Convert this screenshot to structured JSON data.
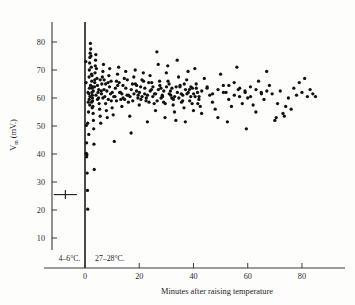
{
  "figure": {
    "background_color": "#fdfdfc",
    "point_color": "#111111",
    "axis_color": "#3a3a3a"
  },
  "axes": {
    "y_label_symbol": "V",
    "y_label_subscript": "m",
    "y_label_units": "(mV.)",
    "x_label": "Minutes after raising temperature",
    "y_ticks": [
      10,
      20,
      30,
      40,
      50,
      60,
      70,
      80
    ],
    "x_ticks": [
      0,
      20,
      40,
      60,
      80
    ],
    "y_tick_labels": [
      "10",
      "20",
      "30",
      "40",
      "50",
      "60",
      "70",
      "80"
    ],
    "x_tick_labels": [
      "0",
      "20",
      "40",
      "60",
      "80"
    ]
  },
  "annotations": {
    "cold_phase_label": "4–6°C.",
    "warm_phase_label": "27–28°C."
  },
  "chart_data": {
    "type": "scatter",
    "title": "",
    "xlabel": "Minutes after raising temperature",
    "ylabel": "Vm (mV.)",
    "xlim": [
      -13,
      94
    ],
    "ylim": [
      4,
      88
    ],
    "grid": false,
    "legend": null,
    "divider_x": 0,
    "cold_phase": {
      "label": "4–6°C.",
      "mean_value": 25.5,
      "error_bar_low": -11.5,
      "error_bar_high": -3.0,
      "marker": "horizontal-error-bar"
    },
    "warm_phase": {
      "label": "27–28°C."
    },
    "points": [
      [
        0.3,
        73.0
      ],
      [
        0.4,
        65.5
      ],
      [
        0.5,
        50.2
      ],
      [
        0.6,
        44.0
      ],
      [
        0.5,
        40.2
      ],
      [
        0.7,
        39.8
      ],
      [
        0.6,
        39.0
      ],
      [
        0.8,
        33.2
      ],
      [
        0.9,
        27.0
      ],
      [
        1.0,
        20.3
      ],
      [
        1.1,
        62.0
      ],
      [
        1.2,
        58.5
      ],
      [
        1.3,
        55.0
      ],
      [
        1.0,
        51.0
      ],
      [
        1.4,
        47.0
      ],
      [
        1.5,
        67.5
      ],
      [
        1.6,
        70.0
      ],
      [
        1.7,
        72.5
      ],
      [
        1.8,
        74.5
      ],
      [
        1.9,
        76.0
      ],
      [
        2.0,
        79.5
      ],
      [
        2.1,
        77.5
      ],
      [
        2.2,
        75.0
      ],
      [
        2.3,
        71.0
      ],
      [
        2.4,
        68.5
      ],
      [
        2.5,
        66.0
      ],
      [
        2.6,
        63.5
      ],
      [
        2.7,
        61.0
      ],
      [
        2.8,
        59.0
      ],
      [
        2.9,
        57.0
      ],
      [
        3.0,
        54.5
      ],
      [
        3.1,
        52.0
      ],
      [
        3.2,
        49.0
      ],
      [
        3.3,
        43.5
      ],
      [
        3.4,
        34.5
      ],
      [
        3.5,
        64.0
      ],
      [
        3.6,
        66.5
      ],
      [
        3.7,
        69.0
      ],
      [
        3.8,
        71.5
      ],
      [
        3.9,
        73.5
      ],
      [
        4.0,
        75.5
      ],
      [
        4.2,
        70.5
      ],
      [
        4.4,
        67.0
      ],
      [
        4.6,
        64.5
      ],
      [
        4.8,
        62.0
      ],
      [
        5.0,
        60.0
      ],
      [
        5.2,
        58.0
      ],
      [
        5.4,
        56.0
      ],
      [
        5.6,
        53.5
      ],
      [
        5.8,
        51.0
      ],
      [
        6.0,
        62.5
      ],
      [
        6.2,
        65.0
      ],
      [
        6.4,
        67.5
      ],
      [
        6.6,
        69.5
      ],
      [
        6.8,
        72.0
      ],
      [
        7.0,
        63.0
      ],
      [
        7.3,
        60.5
      ],
      [
        7.6,
        58.0
      ],
      [
        7.9,
        55.5
      ],
      [
        8.2,
        53.0
      ],
      [
        8.5,
        65.5
      ],
      [
        8.8,
        68.0
      ],
      [
        9.1,
        70.5
      ],
      [
        9.4,
        61.5
      ],
      [
        9.7,
        59.0
      ],
      [
        10.0,
        56.5
      ],
      [
        10.4,
        54.0
      ],
      [
        10.8,
        44.5
      ],
      [
        11.2,
        63.5
      ],
      [
        11.6,
        66.0
      ],
      [
        12.0,
        68.5
      ],
      [
        12.4,
        71.0
      ],
      [
        12.8,
        62.0
      ],
      [
        13.2,
        59.5
      ],
      [
        13.6,
        57.0
      ],
      [
        14.0,
        64.5
      ],
      [
        14.5,
        67.0
      ],
      [
        15.0,
        69.5
      ],
      [
        15.5,
        61.0
      ],
      [
        16.0,
        58.5
      ],
      [
        16.5,
        53.5
      ],
      [
        17.0,
        47.5
      ],
      [
        17.5,
        65.0
      ],
      [
        18.0,
        67.5
      ],
      [
        18.5,
        70.0
      ],
      [
        19.0,
        62.5
      ],
      [
        19.5,
        60.0
      ],
      [
        20.0,
        57.5
      ],
      [
        20.5,
        64.0
      ],
      [
        21.0,
        66.5
      ],
      [
        21.5,
        69.0
      ],
      [
        22.0,
        61.5
      ],
      [
        22.5,
        59.0
      ],
      [
        23.0,
        51.5
      ],
      [
        23.5,
        65.5
      ],
      [
        24.0,
        68.0
      ],
      [
        24.5,
        63.0
      ],
      [
        25.0,
        60.5
      ],
      [
        25.5,
        58.0
      ],
      [
        26.0,
        55.5
      ],
      [
        26.5,
        76.5
      ],
      [
        27.0,
        72.0
      ],
      [
        27.5,
        66.0
      ],
      [
        28.0,
        63.5
      ],
      [
        28.5,
        61.0
      ],
      [
        29.0,
        58.5
      ],
      [
        29.5,
        53.0
      ],
      [
        30.0,
        69.0
      ],
      [
        30.5,
        71.5
      ],
      [
        31.0,
        65.0
      ],
      [
        31.5,
        62.5
      ],
      [
        32.0,
        60.0
      ],
      [
        32.5,
        57.5
      ],
      [
        33.0,
        55.0
      ],
      [
        33.5,
        52.0
      ],
      [
        34.0,
        73.5
      ],
      [
        34.5,
        67.5
      ],
      [
        35.0,
        64.0
      ],
      [
        35.5,
        61.5
      ],
      [
        36.0,
        59.0
      ],
      [
        36.5,
        56.5
      ],
      [
        37.0,
        51.5
      ],
      [
        37.5,
        66.5
      ],
      [
        38.0,
        69.5
      ],
      [
        38.5,
        63.0
      ],
      [
        39.0,
        60.5
      ],
      [
        39.5,
        58.0
      ],
      [
        40.0,
        55.5
      ],
      [
        40.5,
        70.5
      ],
      [
        41.0,
        65.0
      ],
      [
        41.5,
        62.0
      ],
      [
        42.0,
        59.5
      ],
      [
        42.5,
        57.0
      ],
      [
        43.0,
        54.5
      ],
      [
        44.0,
        67.0
      ],
      [
        45.0,
        63.5
      ],
      [
        46.0,
        61.0
      ],
      [
        47.0,
        58.5
      ],
      [
        48.0,
        56.0
      ],
      [
        49.0,
        53.0
      ],
      [
        50.0,
        68.5
      ],
      [
        51.0,
        64.5
      ],
      [
        52.0,
        62.0
      ],
      [
        52.5,
        51.5
      ],
      [
        53.0,
        59.5
      ],
      [
        54.0,
        57.0
      ],
      [
        55.0,
        65.5
      ],
      [
        56.0,
        71.0
      ],
      [
        56.5,
        63.0
      ],
      [
        57.0,
        60.5
      ],
      [
        58.0,
        58.0
      ],
      [
        59.0,
        62.5
      ],
      [
        59.5,
        49.0
      ],
      [
        60.0,
        60.0
      ],
      [
        61.0,
        64.0
      ],
      [
        62.0,
        57.5
      ],
      [
        63.0,
        55.0
      ],
      [
        64.0,
        66.0
      ],
      [
        65.0,
        62.0
      ],
      [
        66.0,
        59.5
      ],
      [
        67.0,
        69.5
      ],
      [
        68.0,
        64.5
      ],
      [
        69.0,
        61.5
      ],
      [
        70.0,
        52.0
      ],
      [
        70.5,
        53.0
      ],
      [
        71.0,
        58.0
      ],
      [
        72.0,
        62.5
      ],
      [
        73.0,
        54.5
      ],
      [
        73.5,
        53.5
      ],
      [
        74.0,
        57.0
      ],
      [
        75.0,
        60.0
      ],
      [
        76.0,
        56.0
      ],
      [
        77.0,
        63.5
      ],
      [
        78.0,
        61.0
      ],
      [
        79.0,
        65.5
      ],
      [
        80.0,
        62.0
      ],
      [
        81.0,
        67.0
      ],
      [
        82.0,
        60.5
      ],
      [
        83.0,
        63.0
      ],
      [
        84.0,
        61.5
      ],
      [
        85.0,
        60.5
      ],
      [
        2.05,
        64.5
      ],
      [
        3.05,
        62.5
      ],
      [
        4.05,
        61.0
      ],
      [
        5.05,
        63.0
      ],
      [
        6.05,
        61.5
      ],
      [
        7.05,
        66.5
      ],
      [
        8.05,
        62.5
      ],
      [
        9.05,
        64.0
      ],
      [
        10.05,
        62.0
      ],
      [
        11.05,
        60.5
      ],
      [
        12.05,
        64.5
      ],
      [
        13.05,
        62.0
      ],
      [
        14.05,
        60.0
      ],
      [
        15.05,
        63.5
      ],
      [
        16.05,
        61.0
      ],
      [
        17.05,
        63.0
      ],
      [
        18.05,
        61.5
      ],
      [
        19.05,
        64.5
      ],
      [
        20.05,
        62.0
      ],
      [
        21.05,
        60.5
      ],
      [
        22.05,
        63.5
      ],
      [
        23.05,
        61.0
      ],
      [
        24.05,
        62.5
      ],
      [
        25.05,
        64.0
      ],
      [
        26.05,
        61.5
      ],
      [
        27.05,
        63.0
      ],
      [
        28.05,
        60.0
      ],
      [
        29.05,
        62.5
      ],
      [
        30.05,
        64.0
      ],
      [
        31.05,
        61.5
      ],
      [
        32.05,
        63.5
      ],
      [
        33.05,
        60.5
      ],
      [
        34.05,
        62.0
      ],
      [
        35.05,
        64.5
      ],
      [
        36.05,
        61.0
      ],
      [
        37.05,
        63.0
      ],
      [
        38.05,
        62.0
      ],
      [
        39.05,
        64.0
      ],
      [
        40.05,
        61.5
      ],
      [
        41.05,
        63.5
      ],
      [
        42.05,
        60.5
      ],
      [
        43.05,
        62.5
      ],
      [
        45.05,
        64.0
      ],
      [
        47.05,
        61.5
      ],
      [
        49.05,
        63.0
      ],
      [
        51.05,
        62.0
      ],
      [
        53.05,
        64.5
      ],
      [
        55.05,
        61.0
      ],
      [
        57.05,
        63.5
      ],
      [
        59.05,
        62.0
      ],
      [
        61.05,
        60.5
      ],
      [
        63.05,
        63.0
      ],
      [
        65.05,
        61.5
      ],
      [
        67.05,
        62.5
      ],
      [
        2.6,
        68.0
      ],
      [
        3.6,
        65.5
      ],
      [
        4.6,
        59.5
      ],
      [
        5.6,
        66.5
      ],
      [
        6.6,
        60.0
      ],
      [
        7.6,
        65.0
      ],
      [
        8.6,
        59.5
      ],
      [
        9.6,
        66.0
      ],
      [
        10.6,
        60.5
      ],
      [
        11.6,
        59.0
      ],
      [
        12.6,
        65.5
      ],
      [
        13.6,
        61.5
      ],
      [
        14.6,
        59.5
      ],
      [
        15.6,
        66.5
      ],
      [
        16.6,
        60.5
      ],
      [
        17.6,
        59.0
      ],
      [
        18.6,
        65.0
      ],
      [
        19.6,
        61.0
      ],
      [
        20.6,
        59.5
      ],
      [
        21.6,
        66.0
      ],
      [
        22.6,
        60.0
      ],
      [
        23.6,
        58.5
      ],
      [
        24.6,
        65.5
      ],
      [
        25.6,
        61.5
      ],
      [
        26.6,
        59.0
      ],
      [
        27.6,
        64.5
      ],
      [
        28.6,
        60.5
      ],
      [
        29.6,
        58.0
      ],
      [
        30.6,
        66.0
      ],
      [
        31.6,
        61.0
      ],
      [
        32.6,
        59.5
      ],
      [
        33.6,
        64.0
      ],
      [
        34.6,
        60.0
      ],
      [
        35.6,
        58.5
      ],
      [
        36.6,
        65.0
      ],
      [
        37.6,
        61.5
      ],
      [
        38.6,
        59.0
      ],
      [
        39.6,
        63.5
      ],
      [
        40.6,
        60.5
      ],
      [
        41.6,
        58.0
      ],
      [
        1.45,
        61.5
      ],
      [
        1.55,
        59.5
      ],
      [
        1.65,
        63.5
      ],
      [
        1.75,
        57.5
      ],
      [
        1.85,
        60.5
      ],
      [
        2.45,
        58.5
      ],
      [
        2.55,
        62.0
      ],
      [
        2.65,
        56.5
      ],
      [
        2.75,
        60.0
      ],
      [
        2.85,
        64.0
      ]
    ]
  }
}
